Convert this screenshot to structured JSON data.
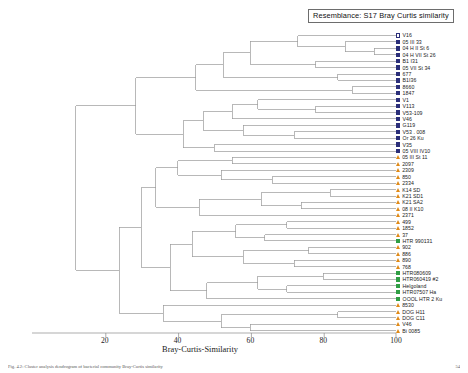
{
  "figure": {
    "resemblance_label": "Resemblance: S17 Bray Curtis similarity",
    "axis_title": "Bray-Curtis-Similarity",
    "caption": "Fig. 4.2: Cluster analysis dendrogram of bacterial community Bray-Curtis similarity",
    "caption_number": "54"
  },
  "chart_data": {
    "type": "dendrogram",
    "title": "Resemblance: S17 Bray Curtis similarity",
    "xlabel": "Bray-Curtis-Similarity",
    "ylabel": "",
    "xlim": [
      0,
      100
    ],
    "xticks": [
      20,
      40,
      60,
      80,
      100
    ],
    "xtick_labels": [
      "20",
      "40",
      "60",
      "80",
      "100"
    ],
    "grid": false,
    "legend_position": "none",
    "orientation": "horizontal-right-rooted",
    "n_leaves": 45,
    "marker_groups": [
      {
        "key": "square-open",
        "shape": "square",
        "fill": "none",
        "color": "#2b2f7a"
      },
      {
        "key": "square-filled",
        "shape": "square",
        "fill": "solid",
        "color": "#2b2f7a"
      },
      {
        "key": "triangle-orange",
        "shape": "triangle",
        "fill": "solid",
        "color": "#e08a18"
      },
      {
        "key": "square-green",
        "shape": "square",
        "fill": "solid",
        "color": "#2f9e44"
      }
    ],
    "leaves": [
      {
        "label": "V16",
        "marker": "square-open",
        "merge_similarity": 100
      },
      {
        "label": "05 III 33",
        "marker": "square-filled",
        "merge_similarity": 74
      },
      {
        "label": "04 H II St 6",
        "marker": "square-filled",
        "merge_similarity": 86
      },
      {
        "label": "04 H VII St 26",
        "marker": "square-filled",
        "merge_similarity": 86
      },
      {
        "label": "B1 I31",
        "marker": "square-filled",
        "merge_similarity": 66
      },
      {
        "label": "05 VII St 34",
        "marker": "square-filled",
        "merge_similarity": 66
      },
      {
        "label": "677",
        "marker": "square-filled",
        "merge_similarity": 57
      },
      {
        "label": "B1I36",
        "marker": "square-filled",
        "merge_similarity": 57
      },
      {
        "label": "8660",
        "marker": "square-filled",
        "merge_similarity": 52
      },
      {
        "label": "1847",
        "marker": "square-filled",
        "merge_similarity": 52
      },
      {
        "label": "V1",
        "marker": "square-filled",
        "merge_similarity": 48
      },
      {
        "label": "V113",
        "marker": "square-filled",
        "merge_similarity": 46
      },
      {
        "label": "V53-109",
        "marker": "square-filled",
        "merge_similarity": 45
      },
      {
        "label": "V46",
        "marker": "square-filled",
        "merge_similarity": 43
      },
      {
        "label": "G119",
        "marker": "square-filled",
        "merge_similarity": 41
      },
      {
        "label": "V53 . 008",
        "marker": "square-filled",
        "merge_similarity": 39
      },
      {
        "label": "Or 26 Ku",
        "marker": "square-filled",
        "merge_similarity": 37
      },
      {
        "label": "V35",
        "marker": "square-filled",
        "merge_similarity": 35
      },
      {
        "label": "05 VIII IV10",
        "marker": "square-filled",
        "merge_similarity": 33
      },
      {
        "label": "05 III St 11",
        "marker": "triangle-orange",
        "merge_similarity": 55
      },
      {
        "label": "2097",
        "marker": "triangle-orange",
        "merge_similarity": 55
      },
      {
        "label": "2309",
        "marker": "triangle-orange",
        "merge_similarity": 47
      },
      {
        "label": "850",
        "marker": "triangle-orange",
        "merge_similarity": 47
      },
      {
        "label": "2334",
        "marker": "triangle-orange",
        "merge_similarity": 44
      },
      {
        "label": "K14 SD",
        "marker": "triangle-orange",
        "merge_similarity": 64
      },
      {
        "label": "K21 SD1",
        "marker": "triangle-orange",
        "merge_similarity": 64
      },
      {
        "label": "K21 SA2",
        "marker": "triangle-orange",
        "merge_similarity": 59
      },
      {
        "label": "08 II K10",
        "marker": "triangle-orange",
        "merge_similarity": 59
      },
      {
        "label": "2371",
        "marker": "triangle-orange",
        "merge_similarity": 50
      },
      {
        "label": "499",
        "marker": "triangle-orange",
        "merge_similarity": 72
      },
      {
        "label": "1852",
        "marker": "triangle-orange",
        "merge_similarity": 72
      },
      {
        "label": "37",
        "marker": "triangle-orange",
        "merge_similarity": 62
      },
      {
        "label": "HTR 990131",
        "marker": "square-green",
        "merge_similarity": 58
      },
      {
        "label": "902",
        "marker": "triangle-orange",
        "merge_similarity": 68
      },
      {
        "label": "886",
        "marker": "triangle-orange",
        "merge_similarity": 68
      },
      {
        "label": "890",
        "marker": "triangle-orange",
        "merge_similarity": 63
      },
      {
        "label": "768",
        "marker": "triangle-orange",
        "merge_similarity": 63
      },
      {
        "label": "HTR080609",
        "marker": "square-green",
        "merge_similarity": 70
      },
      {
        "label": "HTR060419 #2",
        "marker": "square-green",
        "merge_similarity": 70
      },
      {
        "label": "Helgoland",
        "marker": "square-green",
        "merge_similarity": 60
      },
      {
        "label": "HTR07507 Ha",
        "marker": "square-green",
        "merge_similarity": 60
      },
      {
        "label": "OOOL HTR 2 Ku",
        "marker": "square-green",
        "merge_similarity": 54
      },
      {
        "label": "8530",
        "marker": "triangle-orange",
        "merge_similarity": 49
      },
      {
        "label": "DOG H11",
        "marker": "triangle-orange",
        "merge_similarity": 75
      },
      {
        "label": "DOG C11",
        "marker": "triangle-orange",
        "merge_similarity": 75
      },
      {
        "label": "V46",
        "marker": "triangle-orange",
        "merge_similarity": 40
      },
      {
        "label": "Bi 0085",
        "marker": "triangle-orange",
        "merge_similarity": 40
      }
    ]
  }
}
